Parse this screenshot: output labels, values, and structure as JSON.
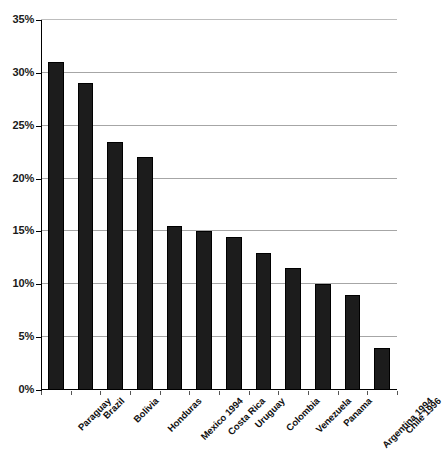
{
  "chart_data": {
    "type": "bar",
    "title": "",
    "subtitle": "",
    "xlabel": "",
    "ylabel": "",
    "categories": [
      "Paraguay",
      "Brazil",
      "Bolivia",
      "Honduras",
      "Mexico 1994",
      "Costa Rica",
      "Uruguay",
      "Colombia",
      "Venezuela",
      "Panama",
      "Argentina 1994",
      "Chile 1996"
    ],
    "values": [
      31.0,
      29.0,
      23.5,
      22.0,
      15.5,
      15.0,
      14.5,
      13.0,
      11.5,
      10.0,
      9.0,
      4.0
    ],
    "value_labels": [
      "31%",
      "29%",
      "23.5%",
      "22%",
      "15.5%",
      "15%",
      "14.5%",
      "13%",
      "11.5%",
      "10%",
      "9%",
      "4%"
    ],
    "ylim": [
      0,
      35
    ],
    "ytick_values": [
      0,
      5,
      10,
      15,
      20,
      25,
      30,
      35
    ],
    "ytick_labels": [
      "0%",
      "5%",
      "10%",
      "15%",
      "20%",
      "25%",
      "30%",
      "35%"
    ],
    "grid": true,
    "grid_axis": "y",
    "legend": false,
    "legend_position": "none",
    "bar_color": "#1c1c1c",
    "gridline_color": "#a6a6a6",
    "axis_color": "#000000",
    "background_color": "#ffffff",
    "xtick_label_rotation": -45
  }
}
